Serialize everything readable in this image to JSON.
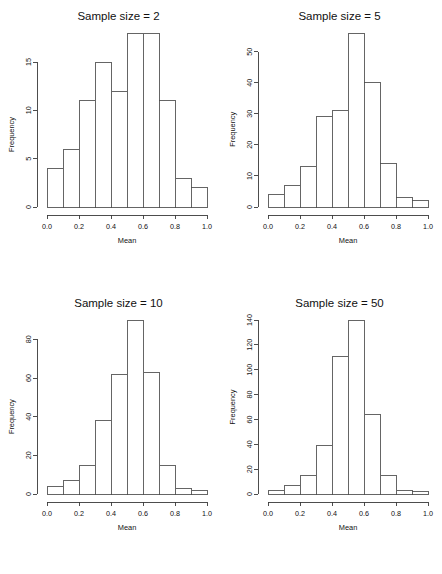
{
  "figure": {
    "type": "histogram-grid",
    "rows": 2,
    "columns": 2,
    "background": "#ffffff",
    "foreground": "#111111"
  },
  "chart_data": [
    {
      "type": "bar",
      "title": "Sample size = 2",
      "xlabel": "Mean",
      "ylabel": "Frequency",
      "categories": [
        "0.0-0.1",
        "0.1-0.2",
        "0.2-0.3",
        "0.3-0.4",
        "0.4-0.5",
        "0.5-0.6",
        "0.6-0.7",
        "0.7-0.8",
        "0.8-0.9",
        "0.9-1.0"
      ],
      "bin_edges": [
        0.0,
        0.1,
        0.2,
        0.3,
        0.4,
        0.5,
        0.6,
        0.7,
        0.8,
        0.9,
        1.0
      ],
      "values": [
        4,
        6,
        11,
        15,
        12,
        18,
        18,
        11,
        3,
        2
      ],
      "xlim": [
        0.0,
        1.0
      ],
      "ylim": [
        0,
        18
      ],
      "xticks": [
        "0.0",
        "0.2",
        "0.4",
        "0.6",
        "0.8",
        "1.0"
      ],
      "xtick_values": [
        0.0,
        0.2,
        0.4,
        0.6,
        0.8,
        1.0
      ],
      "yticks": [
        "0",
        "5",
        "10",
        "15"
      ],
      "ytick_values": [
        0,
        5,
        10,
        15
      ],
      "grid": false,
      "legend": false
    },
    {
      "type": "bar",
      "title": "Sample size = 5",
      "xlabel": "Mean",
      "ylabel": "Frequency",
      "categories": [
        "0.0-0.1",
        "0.1-0.2",
        "0.2-0.3",
        "0.3-0.4",
        "0.4-0.5",
        "0.5-0.6",
        "0.6-0.7",
        "0.7-0.8",
        "0.8-0.9",
        "0.9-1.0"
      ],
      "bin_edges": [
        0.0,
        0.1,
        0.2,
        0.3,
        0.4,
        0.5,
        0.6,
        0.7,
        0.8,
        0.9,
        1.0
      ],
      "values": [
        4,
        7,
        13,
        29,
        31,
        56,
        40,
        14,
        3,
        2
      ],
      "xlim": [
        0.0,
        1.0
      ],
      "ylim": [
        0,
        56
      ],
      "xticks": [
        "0.0",
        "0.2",
        "0.4",
        "0.6",
        "0.8",
        "1.0"
      ],
      "xtick_values": [
        0.0,
        0.2,
        0.4,
        0.6,
        0.8,
        1.0
      ],
      "yticks": [
        "0",
        "10",
        "20",
        "30",
        "40",
        "50"
      ],
      "ytick_values": [
        0,
        10,
        20,
        30,
        40,
        50
      ],
      "grid": false,
      "legend": false
    },
    {
      "type": "bar",
      "title": "Sample size = 10",
      "xlabel": "Mean",
      "ylabel": "Frequency",
      "categories": [
        "0.0-0.1",
        "0.1-0.2",
        "0.2-0.3",
        "0.3-0.4",
        "0.4-0.5",
        "0.5-0.6",
        "0.6-0.7",
        "0.7-0.8",
        "0.8-0.9",
        "0.9-1.0"
      ],
      "bin_edges": [
        0.0,
        0.1,
        0.2,
        0.3,
        0.4,
        0.5,
        0.6,
        0.7,
        0.8,
        0.9,
        1.0
      ],
      "values": [
        4,
        7,
        15,
        38,
        62,
        90,
        63,
        15,
        3,
        2
      ],
      "xlim": [
        0.0,
        1.0
      ],
      "ylim": [
        0,
        90
      ],
      "xticks": [
        "0.0",
        "0.2",
        "0.4",
        "0.6",
        "0.8",
        "1.0"
      ],
      "xtick_values": [
        0.0,
        0.2,
        0.4,
        0.6,
        0.8,
        1.0
      ],
      "yticks": [
        "0",
        "20",
        "40",
        "60",
        "80"
      ],
      "ytick_values": [
        0,
        20,
        40,
        60,
        80
      ],
      "grid": false,
      "legend": false
    },
    {
      "type": "bar",
      "title": "Sample size = 50",
      "xlabel": "Mean",
      "ylabel": "Frequency",
      "categories": [
        "0.0-0.1",
        "0.1-0.2",
        "0.2-0.3",
        "0.3-0.4",
        "0.4-0.5",
        "0.5-0.6",
        "0.6-0.7",
        "0.7-0.8",
        "0.8-0.9",
        "0.9-1.0"
      ],
      "bin_edges": [
        0.0,
        0.1,
        0.2,
        0.3,
        0.4,
        0.5,
        0.6,
        0.7,
        0.8,
        0.9,
        1.0
      ],
      "values": [
        3,
        7,
        15,
        39,
        111,
        140,
        64,
        15,
        3,
        2
      ],
      "xlim": [
        0.0,
        1.0
      ],
      "ylim": [
        0,
        140
      ],
      "xticks": [
        "0.0",
        "0.2",
        "0.4",
        "0.6",
        "0.8",
        "1.0"
      ],
      "xtick_values": [
        0.0,
        0.2,
        0.4,
        0.6,
        0.8,
        1.0
      ],
      "yticks": [
        "0",
        "20",
        "40",
        "60",
        "80",
        "100",
        "120",
        "140"
      ],
      "ytick_values": [
        0,
        20,
        40,
        60,
        80,
        100,
        120,
        140
      ],
      "grid": false,
      "legend": false
    }
  ]
}
